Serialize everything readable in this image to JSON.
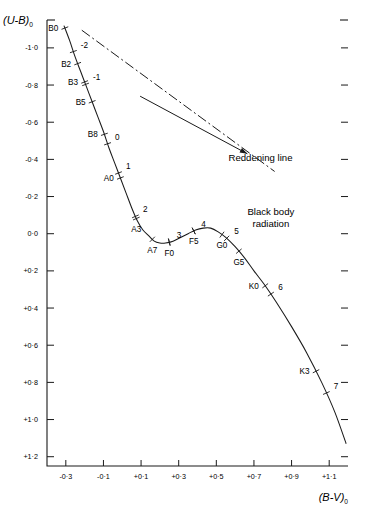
{
  "chart_data": {
    "type": "line",
    "title": "",
    "xlabel": "(B-V)0",
    "ylabel": "(U-B)0",
    "xlabel_display": "(B-V)",
    "xlabel_sub": "0",
    "ylabel_display": "(U-B)",
    "ylabel_sub": "0",
    "xlim": [
      -0.4,
      1.2
    ],
    "ylim": [
      1.25,
      -1.15
    ],
    "grid": false,
    "legend": "none",
    "x_ticks": [
      {
        "value": -0.3,
        "label": "-0·3"
      },
      {
        "value": -0.1,
        "label": "-0·1"
      },
      {
        "value": 0.1,
        "label": "+0·1"
      },
      {
        "value": 0.3,
        "label": "+0·3"
      },
      {
        "value": 0.5,
        "label": "+0·5"
      },
      {
        "value": 0.7,
        "label": "+0·7"
      },
      {
        "value": 0.9,
        "label": "+0·9"
      },
      {
        "value": 1.1,
        "label": "+1·1"
      }
    ],
    "y_ticks": [
      {
        "value": -1.0,
        "label": "-1·0"
      },
      {
        "value": -0.8,
        "label": "-0·8"
      },
      {
        "value": -0.6,
        "label": "-0·6"
      },
      {
        "value": -0.4,
        "label": "-0·4"
      },
      {
        "value": -0.2,
        "label": "-0·2"
      },
      {
        "value": 0.0,
        "label": "0·0"
      },
      {
        "value": 0.2,
        "label": "+0·2"
      },
      {
        "value": 0.4,
        "label": "+0·4"
      },
      {
        "value": 0.6,
        "label": "+0·6"
      },
      {
        "value": 0.8,
        "label": "+0·8"
      },
      {
        "value": 1.0,
        "label": "+1·0"
      },
      {
        "value": 1.2,
        "label": "+1·2"
      }
    ],
    "series": [
      {
        "name": "main-sequence",
        "comment": "Main sequence locus in the (U-B)0 vs (B-V)0 two-colour diagram",
        "x": [
          -0.31,
          -0.28,
          -0.25,
          -0.22,
          -0.19,
          -0.16,
          -0.13,
          -0.1,
          -0.07,
          -0.04,
          -0.01,
          0.02,
          0.05,
          0.08,
          0.11,
          0.14,
          0.17,
          0.2,
          0.23,
          0.27,
          0.31,
          0.35,
          0.39,
          0.43,
          0.47,
          0.51,
          0.55,
          0.6,
          0.65,
          0.7,
          0.76,
          0.82,
          0.9,
          0.98,
          1.06,
          1.13,
          1.19
        ],
        "y": [
          -1.12,
          -1.04,
          -0.95,
          -0.87,
          -0.79,
          -0.71,
          -0.63,
          -0.55,
          -0.46,
          -0.38,
          -0.3,
          -0.22,
          -0.14,
          -0.07,
          -0.02,
          0.01,
          0.04,
          0.05,
          0.05,
          0.04,
          0.02,
          0.0,
          -0.02,
          -0.03,
          -0.03,
          -0.01,
          0.02,
          0.07,
          0.13,
          0.2,
          0.28,
          0.37,
          0.5,
          0.64,
          0.8,
          0.96,
          1.13
        ]
      }
    ],
    "spectral_markers": [
      {
        "label": "B0",
        "x": -0.305,
        "y": -1.105,
        "side": "left"
      },
      {
        "label": "B2",
        "x": -0.237,
        "y": -0.9,
        "side": "left"
      },
      {
        "label": "B3",
        "x": -0.2,
        "y": -0.795,
        "side": "left"
      },
      {
        "label": "B5",
        "x": -0.16,
        "y": -0.68,
        "side": "left"
      },
      {
        "label": "B8",
        "x": -0.095,
        "y": -0.49,
        "side": "left"
      },
      {
        "label": "A0",
        "x": -0.01,
        "y": -0.295,
        "side": "left"
      },
      {
        "label": "A3",
        "x": 0.075,
        "y": -0.085,
        "side": "below"
      },
      {
        "label": "A7",
        "x": 0.16,
        "y": 0.025,
        "side": "below"
      },
      {
        "label": "F0",
        "x": 0.25,
        "y": 0.04,
        "side": "below"
      },
      {
        "label": "F5",
        "x": 0.38,
        "y": -0.005,
        "side": "below"
      },
      {
        "label": "G0",
        "x": 0.53,
        "y": 0.045,
        "side": "below"
      },
      {
        "label": "G5",
        "x": 0.62,
        "y": 0.145,
        "side": "below"
      },
      {
        "label": "K0",
        "x": 0.76,
        "y": 0.39,
        "side": "left"
      },
      {
        "label": "K3",
        "x": 1.03,
        "y": 0.825,
        "side": "left"
      }
    ],
    "numeric_markers": [
      {
        "label": "-2",
        "x": -0.26,
        "y": -0.955
      },
      {
        "label": "-1",
        "x": -0.195,
        "y": -0.795
      },
      {
        "label": "0",
        "x": -0.078,
        "y": -0.445
      },
      {
        "label": "1",
        "x": -0.02,
        "y": -0.28
      },
      {
        "label": "2",
        "x": 0.07,
        "y": -0.08
      },
      {
        "label": "3",
        "x": 0.25,
        "y": 0.035
      },
      {
        "label": "4",
        "x": 0.38,
        "y": -0.01
      },
      {
        "label": "5",
        "x": 0.555,
        "y": 0.065
      },
      {
        "label": "6",
        "x": 0.79,
        "y": 0.39
      },
      {
        "label": "7",
        "x": 1.085,
        "y": 0.94
      }
    ],
    "annotations": [
      {
        "name": "reddening-line",
        "text": "Reddening line",
        "x": 0.735,
        "y": -0.39
      },
      {
        "name": "black-body-radiation",
        "text_line1": "Black body",
        "text_line2": "radiation",
        "x": 0.79,
        "y": -0.1
      }
    ],
    "reddening_arrow": {
      "x1": 0.095,
      "y1": -0.74,
      "x2": 0.665,
      "y2": -0.43,
      "comment": "arrow pointing from upper-left toward lower-right, head at label"
    },
    "blackbody_line": {
      "style": "dash-dot",
      "x1": -0.215,
      "y1": -1.095,
      "x2": 0.81,
      "y2": -0.335
    },
    "colors": {
      "axis": "#1a1a1a",
      "curve": "#1a1a1a",
      "text": "#000000",
      "background": "#ffffff"
    }
  }
}
